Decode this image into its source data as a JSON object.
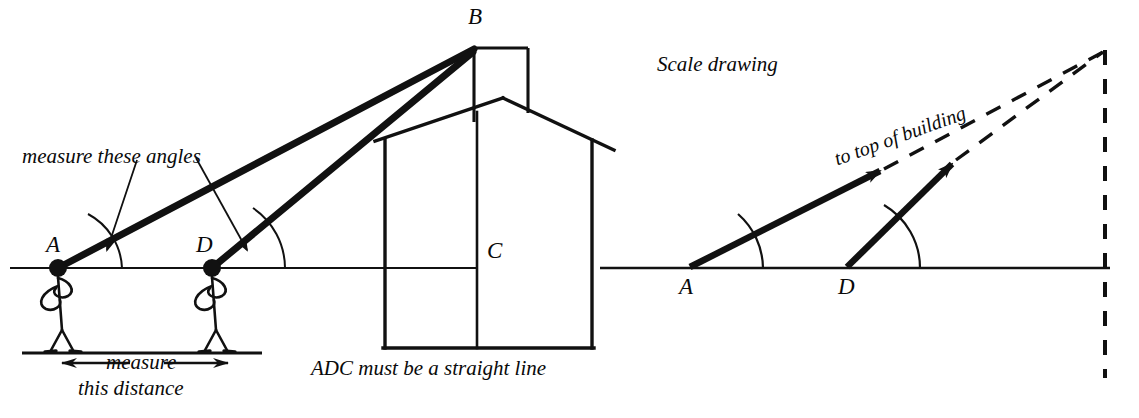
{
  "figure": {
    "title_note": "Scale drawing"
  },
  "left_diagram": {
    "name": "field-sketch",
    "points": [
      {
        "id": "A",
        "label": "A",
        "x": 58,
        "y": 268,
        "label_x": 46,
        "label_y": 232
      },
      {
        "id": "D",
        "label": "D",
        "x": 212,
        "y": 268,
        "label_x": 196,
        "label_y": 232
      },
      {
        "id": "B",
        "label": "B",
        "x": 474,
        "y": 48,
        "label_x": 468,
        "label_y": 4
      },
      {
        "id": "C",
        "label": "C",
        "x": 477,
        "y": 268,
        "label_x": 487,
        "label_y": 238
      }
    ],
    "annotations": [
      {
        "id": "measure-angles",
        "text": "measure these angles",
        "x": 22,
        "y": 144
      },
      {
        "id": "measure-distance-line1",
        "text": "measure",
        "x": 106,
        "y": 362
      },
      {
        "id": "measure-distance-line2",
        "text": "this distance",
        "x": 78,
        "y": 388
      },
      {
        "id": "straight-line-note",
        "text": "ADC must be a straight line",
        "x": 311,
        "y": 358
      }
    ],
    "baseline_y": 268,
    "ground_y": 352
  },
  "right_diagram": {
    "name": "scale-drawing",
    "title": "Scale drawing",
    "title_x": 657,
    "title_y": 52,
    "points": [
      {
        "id": "A",
        "label": "A",
        "x": 690,
        "y": 268,
        "label_x": 679,
        "label_y": 274
      },
      {
        "id": "D",
        "label": "D",
        "x": 847,
        "y": 268,
        "label_x": 838,
        "label_y": 274
      }
    ],
    "annotations": [
      {
        "id": "to-top-of-building",
        "text": "to top of building",
        "x": 835,
        "y": 148,
        "rotation_deg": -20
      }
    ],
    "baseline_y": 268,
    "apex": {
      "x": 1105,
      "y": 50
    }
  },
  "colors": {
    "ink": "#111111",
    "paper": "#ffffff"
  },
  "icons": {
    "left_arrow": "left-arrow-icon",
    "right_arrow": "right-arrow-icon",
    "angle_arc": "angle-arc-icon",
    "sight-arrow": "sight-arrow-icon"
  }
}
